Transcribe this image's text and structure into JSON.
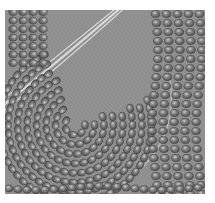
{
  "image": {
    "subject": "beadwork-close-up",
    "description": "Grayscale close-up photograph of seed beads stitched in concentric curved rows on fabric",
    "palette": {
      "background": "#ffffff",
      "fabric": "#8e8e8e",
      "bead": "#767676",
      "bead_shadow": "#4e4e4e",
      "bead_highlight": "#c8c8c8",
      "thread": "#e6e6e6"
    },
    "curl_center": [
      70,
      115
    ]
  }
}
